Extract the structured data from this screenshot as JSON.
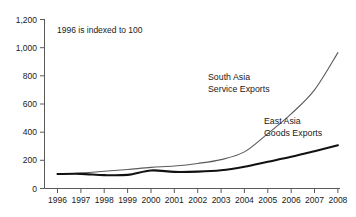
{
  "chart_data": {
    "type": "line",
    "title": "",
    "subtitle": "",
    "annotation": "1996 is indexed to 100",
    "xlabel": "",
    "ylabel": "",
    "x": [
      1996,
      1997,
      1998,
      1999,
      2000,
      2001,
      2002,
      2003,
      2004,
      2005,
      2006,
      2007,
      2008
    ],
    "categories": [
      "1996",
      "1997",
      "1998",
      "1999",
      "2000",
      "2001",
      "2002",
      "2003",
      "2004",
      "2005",
      "2006",
      "2007",
      "2008"
    ],
    "xlim": [
      1996,
      2008
    ],
    "ylim": [
      0,
      1200
    ],
    "yticks": [
      0,
      200,
      400,
      600,
      800,
      1000,
      1200
    ],
    "ytick_labels": [
      "0",
      "200",
      "400",
      "600",
      "800",
      "1,000",
      "1,200"
    ],
    "grid": false,
    "legend_position": "inline-annotations",
    "series": [
      {
        "name": "South Asia Service Exports",
        "label_line1": "South Asia",
        "label_line2": "Service Exports",
        "color": "#5b5b5b",
        "values": [
          100,
          110,
          122,
          135,
          150,
          160,
          178,
          205,
          260,
          390,
          530,
          700,
          965
        ]
      },
      {
        "name": "East Asia Goods Exports",
        "label_line1": "East Asia",
        "label_line2": "Goods Exports",
        "color": "#111111",
        "values": [
          103,
          104,
          95,
          97,
          128,
          118,
          120,
          130,
          155,
          190,
          225,
          265,
          307
        ]
      }
    ]
  },
  "axis": {
    "y_tick_labels": [
      "1,200",
      "1,000",
      "800",
      "600",
      "400",
      "200",
      "0"
    ],
    "x_tick_labels": [
      "1996",
      "1997",
      "1998",
      "1999",
      "2000",
      "2001",
      "2002",
      "2003",
      "2004",
      "2005",
      "2006",
      "2007",
      "2008"
    ]
  },
  "annotations": {
    "index_note": "1996 is indexed to 100",
    "south_asia_line1": "South Asia",
    "south_asia_line2": "Service Exports",
    "east_asia_line1": "East Asia",
    "east_asia_line2": "Goods Exports"
  },
  "colors": {
    "south_asia": "#5b5b5b",
    "east_asia": "#111111",
    "axis": "#5a5a5a",
    "text": "#1a1a1a",
    "background": "#ffffff"
  }
}
